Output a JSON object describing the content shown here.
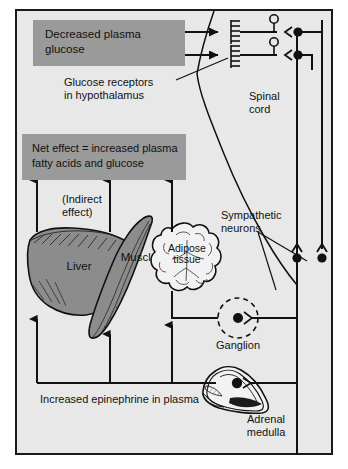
{
  "figure": {
    "background_color": "#e8e8e8",
    "frame_color": "#1a1a1a",
    "box_fill": "#9a9a9a",
    "ink_color": "#111111",
    "organ_fill": "#8c8c8c"
  },
  "boxes": {
    "stimulus": {
      "line1": "Decreased plasma",
      "line2": "glucose"
    },
    "net_effect": {
      "line1": "Net effect = increased plasma",
      "line2": "fatty acids and glucose"
    }
  },
  "labels": {
    "glucose_receptors_l1": "Glucose receptors",
    "glucose_receptors_l2": "in hypothalamus",
    "spinal_cord_l1": "Spinal",
    "spinal_cord_l2": "cord",
    "sympathetic_l1": "Sympathetic",
    "sympathetic_l2": "neurons",
    "indirect_l1": "(Indirect",
    "indirect_l2": "effect)",
    "ganglion": "Ganglion",
    "adrenal_l1": "Adrenal",
    "adrenal_l2": "medulla",
    "epinephrine": "Increased epinephrine in plasma"
  },
  "organs": {
    "liver": "Liver",
    "muscle": "Muscle",
    "adipose_l1": "Adipose",
    "adipose_l2": "tissue"
  }
}
